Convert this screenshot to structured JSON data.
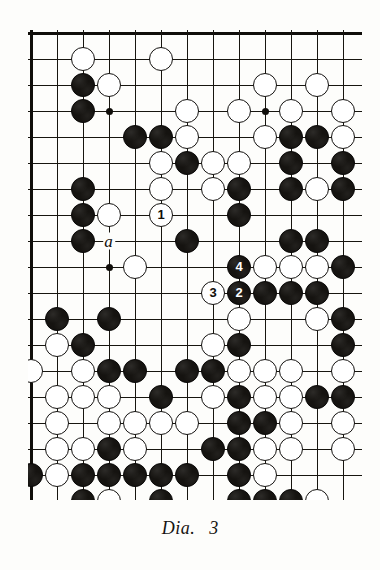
{
  "figure": {
    "caption_label": "Dia.",
    "caption_number": "3",
    "kind": "go-board-diagram"
  },
  "board": {
    "columns": 13,
    "rows": 18,
    "cell_size": 26,
    "origin_x": 3,
    "origin_y": 3,
    "edges": {
      "top": true,
      "left": true,
      "bottom": true,
      "right": false
    },
    "line_color": "#17150f",
    "black_color": "#151310",
    "white_color": "#ffffff",
    "hoshi_points": [
      {
        "col": 3,
        "row": 3
      },
      {
        "col": 9,
        "row": 3
      },
      {
        "col": 3,
        "row": 9
      }
    ],
    "markers": [
      {
        "label": "a",
        "col": 3,
        "row": 8
      }
    ],
    "numbered_stones": [
      {
        "number": "1",
        "color": "white",
        "col": 5,
        "row": 7
      },
      {
        "number": "2",
        "color": "black",
        "col": 8,
        "row": 10
      },
      {
        "number": "3",
        "color": "white",
        "col": 7,
        "row": 10
      },
      {
        "number": "4",
        "color": "black",
        "col": 8,
        "row": 9
      }
    ],
    "stones": [
      {
        "color": "white",
        "col": 2,
        "row": 1
      },
      {
        "color": "white",
        "col": 5,
        "row": 1
      },
      {
        "color": "black",
        "col": 2,
        "row": 2
      },
      {
        "color": "white",
        "col": 3,
        "row": 2
      },
      {
        "color": "white",
        "col": 9,
        "row": 2
      },
      {
        "color": "white",
        "col": 11,
        "row": 2
      },
      {
        "color": "black",
        "col": 2,
        "row": 3
      },
      {
        "color": "white",
        "col": 6,
        "row": 3
      },
      {
        "color": "white",
        "col": 8,
        "row": 3
      },
      {
        "color": "white",
        "col": 10,
        "row": 3
      },
      {
        "color": "white",
        "col": 12,
        "row": 3
      },
      {
        "color": "black",
        "col": 4,
        "row": 4
      },
      {
        "color": "black",
        "col": 5,
        "row": 4
      },
      {
        "color": "white",
        "col": 6,
        "row": 4
      },
      {
        "color": "white",
        "col": 9,
        "row": 4
      },
      {
        "color": "black",
        "col": 10,
        "row": 4
      },
      {
        "color": "black",
        "col": 11,
        "row": 4
      },
      {
        "color": "white",
        "col": 12,
        "row": 4
      },
      {
        "color": "white",
        "col": 5,
        "row": 5
      },
      {
        "color": "black",
        "col": 6,
        "row": 5
      },
      {
        "color": "white",
        "col": 7,
        "row": 5
      },
      {
        "color": "white",
        "col": 8,
        "row": 5
      },
      {
        "color": "black",
        "col": 10,
        "row": 5
      },
      {
        "color": "black",
        "col": 12,
        "row": 5
      },
      {
        "color": "black",
        "col": 2,
        "row": 6
      },
      {
        "color": "white",
        "col": 5,
        "row": 6
      },
      {
        "color": "white",
        "col": 7,
        "row": 6
      },
      {
        "color": "black",
        "col": 8,
        "row": 6
      },
      {
        "color": "black",
        "col": 10,
        "row": 6
      },
      {
        "color": "white",
        "col": 11,
        "row": 6
      },
      {
        "color": "black",
        "col": 12,
        "row": 6
      },
      {
        "color": "black",
        "col": 2,
        "row": 7
      },
      {
        "color": "white",
        "col": 3,
        "row": 7
      },
      {
        "color": "black",
        "col": 8,
        "row": 7
      },
      {
        "color": "black",
        "col": 2,
        "row": 8
      },
      {
        "color": "black",
        "col": 6,
        "row": 8
      },
      {
        "color": "black",
        "col": 10,
        "row": 8
      },
      {
        "color": "black",
        "col": 11,
        "row": 8
      },
      {
        "color": "white",
        "col": 4,
        "row": 9
      },
      {
        "color": "white",
        "col": 9,
        "row": 9
      },
      {
        "color": "white",
        "col": 10,
        "row": 9
      },
      {
        "color": "white",
        "col": 11,
        "row": 9
      },
      {
        "color": "black",
        "col": 12,
        "row": 9
      },
      {
        "color": "black",
        "col": 9,
        "row": 10
      },
      {
        "color": "black",
        "col": 10,
        "row": 10
      },
      {
        "color": "black",
        "col": 11,
        "row": 10
      },
      {
        "color": "black",
        "col": 1,
        "row": 11
      },
      {
        "color": "black",
        "col": 3,
        "row": 11
      },
      {
        "color": "white",
        "col": 8,
        "row": 11
      },
      {
        "color": "white",
        "col": 11,
        "row": 11
      },
      {
        "color": "black",
        "col": 12,
        "row": 11
      },
      {
        "color": "white",
        "col": 1,
        "row": 12
      },
      {
        "color": "black",
        "col": 2,
        "row": 12
      },
      {
        "color": "white",
        "col": 7,
        "row": 12
      },
      {
        "color": "black",
        "col": 8,
        "row": 12
      },
      {
        "color": "black",
        "col": 12,
        "row": 12
      },
      {
        "color": "white",
        "col": 0,
        "row": 13
      },
      {
        "color": "white",
        "col": 2,
        "row": 13
      },
      {
        "color": "black",
        "col": 3,
        "row": 13
      },
      {
        "color": "black",
        "col": 4,
        "row": 13
      },
      {
        "color": "black",
        "col": 6,
        "row": 13
      },
      {
        "color": "black",
        "col": 7,
        "row": 13
      },
      {
        "color": "white",
        "col": 8,
        "row": 13
      },
      {
        "color": "white",
        "col": 9,
        "row": 13
      },
      {
        "color": "white",
        "col": 10,
        "row": 13
      },
      {
        "color": "white",
        "col": 12,
        "row": 13
      },
      {
        "color": "white",
        "col": 1,
        "row": 14
      },
      {
        "color": "white",
        "col": 2,
        "row": 14
      },
      {
        "color": "white",
        "col": 3,
        "row": 14
      },
      {
        "color": "black",
        "col": 5,
        "row": 14
      },
      {
        "color": "white",
        "col": 7,
        "row": 14
      },
      {
        "color": "black",
        "col": 8,
        "row": 14
      },
      {
        "color": "white",
        "col": 9,
        "row": 14
      },
      {
        "color": "white",
        "col": 10,
        "row": 14
      },
      {
        "color": "black",
        "col": 11,
        "row": 14
      },
      {
        "color": "black",
        "col": 12,
        "row": 14
      },
      {
        "color": "white",
        "col": 1,
        "row": 15
      },
      {
        "color": "white",
        "col": 3,
        "row": 15
      },
      {
        "color": "white",
        "col": 4,
        "row": 15
      },
      {
        "color": "white",
        "col": 5,
        "row": 15
      },
      {
        "color": "white",
        "col": 6,
        "row": 15
      },
      {
        "color": "black",
        "col": 8,
        "row": 15
      },
      {
        "color": "black",
        "col": 9,
        "row": 15
      },
      {
        "color": "white",
        "col": 10,
        "row": 15
      },
      {
        "color": "white",
        "col": 12,
        "row": 15
      },
      {
        "color": "white",
        "col": 1,
        "row": 16
      },
      {
        "color": "white",
        "col": 2,
        "row": 16
      },
      {
        "color": "black",
        "col": 3,
        "row": 16
      },
      {
        "color": "white",
        "col": 4,
        "row": 16
      },
      {
        "color": "black",
        "col": 7,
        "row": 16
      },
      {
        "color": "black",
        "col": 8,
        "row": 16
      },
      {
        "color": "white",
        "col": 9,
        "row": 16
      },
      {
        "color": "white",
        "col": 10,
        "row": 16
      },
      {
        "color": "white",
        "col": 12,
        "row": 16
      },
      {
        "color": "black",
        "col": 0,
        "row": 17
      },
      {
        "color": "white",
        "col": 1,
        "row": 17
      },
      {
        "color": "black",
        "col": 2,
        "row": 17
      },
      {
        "color": "black",
        "col": 3,
        "row": 17
      },
      {
        "color": "black",
        "col": 4,
        "row": 17
      },
      {
        "color": "black",
        "col": 5,
        "row": 17
      },
      {
        "color": "black",
        "col": 6,
        "row": 17
      },
      {
        "color": "black",
        "col": 8,
        "row": 17
      },
      {
        "color": "white",
        "col": 9,
        "row": 17
      },
      {
        "color": "black",
        "col": 2,
        "row": 18
      },
      {
        "color": "white",
        "col": 3,
        "row": 18
      },
      {
        "color": "black",
        "col": 5,
        "row": 18
      },
      {
        "color": "black",
        "col": 8,
        "row": 18
      },
      {
        "color": "black",
        "col": 9,
        "row": 18
      },
      {
        "color": "black",
        "col": 10,
        "row": 18
      },
      {
        "color": "white",
        "col": 11,
        "row": 18
      }
    ]
  }
}
